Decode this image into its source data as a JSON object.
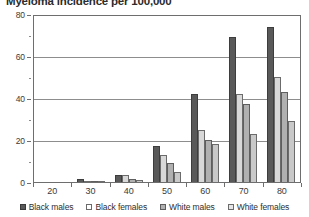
{
  "chart_data": {
    "type": "bar",
    "title": "Myeloma incidence per 100,000",
    "xlabel": "",
    "ylabel": "",
    "ylim": [
      0,
      80
    ],
    "yticks": [
      0,
      20,
      40,
      60,
      80
    ],
    "yticks_minor": [
      10,
      30,
      50,
      70
    ],
    "grid": true,
    "legend_position": "bottom",
    "categories": [
      "20",
      "30",
      "40",
      "50",
      "60",
      "70",
      "80"
    ],
    "series": [
      {
        "name": "Black males",
        "color": "#595959",
        "values": [
          0,
          1.5,
          3.5,
          17,
          42,
          69,
          74
        ]
      },
      {
        "name": "Black females",
        "color": "#d8d8d8",
        "values": [
          0,
          0.6,
          3.5,
          13,
          25,
          42,
          50
        ]
      },
      {
        "name": "White males",
        "color": "#b0b0b0",
        "values": [
          0,
          0.5,
          1.5,
          9,
          20,
          37,
          43
        ]
      },
      {
        "name": "White females",
        "color": "#c9c9c9",
        "values": [
          0,
          0.3,
          1.0,
          5,
          18,
          23,
          29
        ]
      }
    ]
  },
  "legend": {
    "items": [
      {
        "label": "Black males"
      },
      {
        "label": "Black females"
      },
      {
        "label": "White males"
      },
      {
        "label": "White females"
      }
    ]
  }
}
